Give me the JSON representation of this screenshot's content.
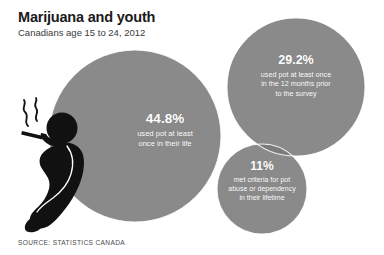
{
  "header": {
    "title": "Marijuana and youth",
    "subtitle": "Canadians age 15 to 24, 2012"
  },
  "source": {
    "text": "SOURCE: STATISTICS CANADA"
  },
  "colors": {
    "background": "#ffffff",
    "circle_fill": "#8a8a8a",
    "circle_overlap": "#7b7b7b",
    "circle_stroke": "#ffffff",
    "label_text": "#ffffff",
    "title_text": "#1a1a1a",
    "silhouette": "#111111"
  },
  "icons": {
    "smoker": "smoking-person-silhouette-icon"
  },
  "chart_data": {
    "type": "pie",
    "variant": "venn-proportional-bubbles",
    "title": "Marijuana and youth",
    "subtitle": "Canadians age 15 to 24, 2012",
    "xlabel": "",
    "ylabel": "",
    "unit": "percent",
    "legend": "none",
    "grid": false,
    "source": "SOURCE: STATISTICS CANADA",
    "categories": [
      "used pot at least once in their life",
      "used pot at least once in the 12 months prior to the survey",
      "met criteria for pot abuse or dependency in their lifetime"
    ],
    "values": [
      44.8,
      29.2,
      11
    ],
    "series": [
      {
        "name": "Marijuana use among Canadians age 15 to 24, 2012",
        "values": [
          44.8,
          29.2,
          11
        ]
      }
    ],
    "bubbles": [
      {
        "id": "lifetime",
        "value": 44.8,
        "value_label": "44.8%",
        "description": "used pot at least\nonce in their life",
        "description_lines": [
          "used pot at least",
          "once in their life"
        ],
        "cx": 135,
        "cy": 136,
        "r": 86
      },
      {
        "id": "past-year",
        "value": 29.2,
        "value_label": "29.2%",
        "description": "used pot at least once in the 12 months prior to the survey",
        "description_lines": [
          "used pot at least once",
          "in the 12 months prior",
          "to the survey"
        ],
        "cx": 296,
        "cy": 87,
        "r": 69
      },
      {
        "id": "abuse",
        "value": 11,
        "value_label": "11%",
        "description": "met criteria for pot abuse or dependency in their lifetime",
        "description_lines": [
          "met criteria for pot",
          "abuse or dependency",
          "in their lifetime"
        ],
        "cx": 262,
        "cy": 189,
        "r": 45
      }
    ]
  }
}
